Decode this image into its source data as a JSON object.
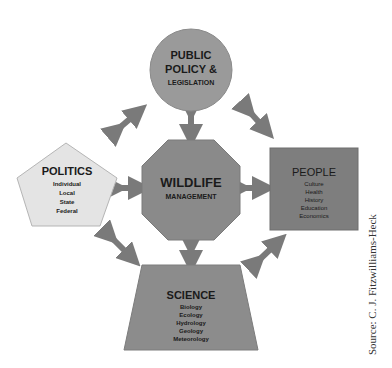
{
  "diagram": {
    "center": {
      "title": "WILDLIFE",
      "subtitle": "MANAGEMENT",
      "shape": "octagon",
      "color": "#8a8a8a"
    },
    "top": {
      "lines": [
        "PUBLIC",
        "POLICY &",
        "LEGISLATION"
      ],
      "shape": "circle",
      "color": "#9a9a9a"
    },
    "left": {
      "title": "POLITICS",
      "items": [
        "Individual",
        "Local",
        "State",
        "Federal"
      ],
      "shape": "pentagon",
      "color": "#e4e4e4"
    },
    "right": {
      "title": "PEOPLE",
      "items": [
        "Culture",
        "Health",
        "History",
        "Education",
        "Economics"
      ],
      "shape": "square",
      "color": "#7e7e7e"
    },
    "bottom": {
      "title": "SCIENCE",
      "items": [
        "Biology",
        "Ecology",
        "Hydrology",
        "Geology",
        "Meteorology"
      ],
      "shape": "trapezoid",
      "color": "#8c8c8c"
    },
    "arrow_color": "#7a7a7a"
  },
  "source": "Source: C. J. Fitzwilliams-Heck"
}
